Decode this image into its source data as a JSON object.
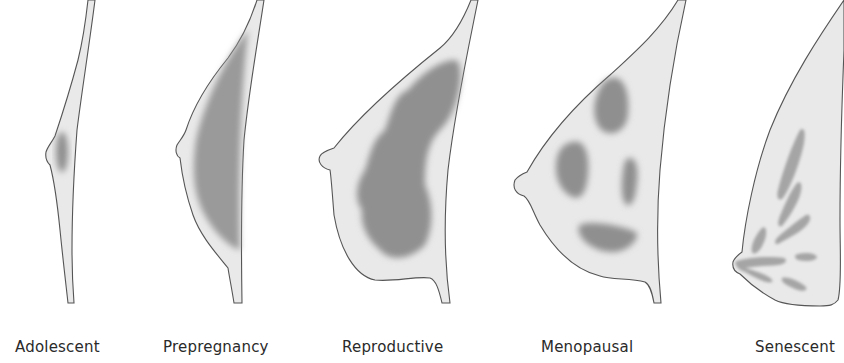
{
  "figure": {
    "colors": {
      "outline": "#555555",
      "skin_fill": "#e9e9e9",
      "tissue_dark": "#8f8f8f",
      "tissue_mid": "#a9a9a9",
      "label_text": "#2a2a2a"
    },
    "stages": [
      {
        "id": "adolescent",
        "label": "Adolescent"
      },
      {
        "id": "prepregnancy",
        "label": "Prepregnancy"
      },
      {
        "id": "reproductive",
        "label": "Reproductive"
      },
      {
        "id": "menopausal",
        "label": "Menopausal"
      },
      {
        "id": "senescent",
        "label": "Senescent"
      }
    ]
  }
}
